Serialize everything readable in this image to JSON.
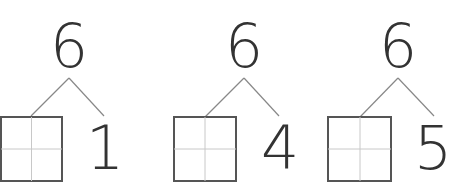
{
  "worksheet": {
    "groups": [
      {
        "total": "6",
        "known_part": "1",
        "unknown_part": ""
      },
      {
        "total": "6",
        "known_part": "4",
        "unknown_part": ""
      },
      {
        "total": "6",
        "known_part": "5",
        "unknown_part": ""
      }
    ]
  },
  "colors": {
    "digit": "#333333",
    "box_border": "#555555",
    "grid_line": "#c8c8c8",
    "branch_line": "#888888"
  }
}
